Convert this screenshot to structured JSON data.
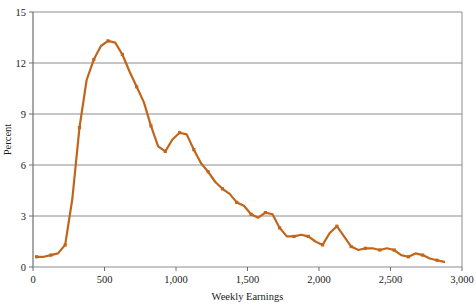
{
  "chart_data": {
    "type": "line",
    "title": "",
    "xlabel": "Weekly Earnings",
    "ylabel": "Percent",
    "xlim": [
      0,
      3000
    ],
    "ylim": [
      0,
      15
    ],
    "grid": true,
    "legend": "none",
    "line_color": "#C1651A",
    "marker": "square",
    "x_ticks": [
      0,
      500,
      1000,
      1500,
      2000,
      2500,
      3000
    ],
    "x_tick_labels": [
      "0",
      "500",
      "1,000",
      "1,500",
      "2,000",
      "2,500",
      "3,000"
    ],
    "y_ticks": [
      0,
      3,
      6,
      9,
      12,
      15
    ],
    "y_tick_labels": [
      "0",
      "3",
      "6",
      "9",
      "12",
      "15"
    ],
    "x": [
      25,
      75,
      125,
      175,
      225,
      275,
      325,
      375,
      425,
      475,
      525,
      575,
      625,
      675,
      725,
      775,
      825,
      875,
      925,
      975,
      1025,
      1075,
      1125,
      1175,
      1225,
      1275,
      1325,
      1375,
      1425,
      1475,
      1525,
      1575,
      1625,
      1675,
      1725,
      1775,
      1825,
      1875,
      1925,
      1975,
      2025,
      2075,
      2125,
      2175,
      2225,
      2275,
      2325,
      2375,
      2425,
      2475,
      2525,
      2575,
      2625,
      2675,
      2725,
      2775,
      2825,
      2875
    ],
    "values": [
      0.6,
      0.6,
      0.7,
      0.8,
      1.3,
      4.0,
      8.2,
      11.0,
      12.2,
      13.0,
      13.3,
      13.2,
      12.5,
      11.5,
      10.6,
      9.7,
      8.3,
      7.1,
      6.8,
      7.5,
      7.9,
      7.8,
      6.9,
      6.1,
      5.6,
      5.0,
      4.6,
      4.3,
      3.8,
      3.6,
      3.1,
      2.9,
      3.2,
      3.1,
      2.3,
      1.8,
      1.8,
      1.9,
      1.8,
      1.5,
      1.3,
      2.0,
      2.4,
      1.8,
      1.2,
      1.0,
      1.1,
      1.1,
      1.0,
      1.1,
      1.0,
      0.7,
      0.6,
      0.8,
      0.7,
      0.5,
      0.4,
      0.3
    ]
  }
}
